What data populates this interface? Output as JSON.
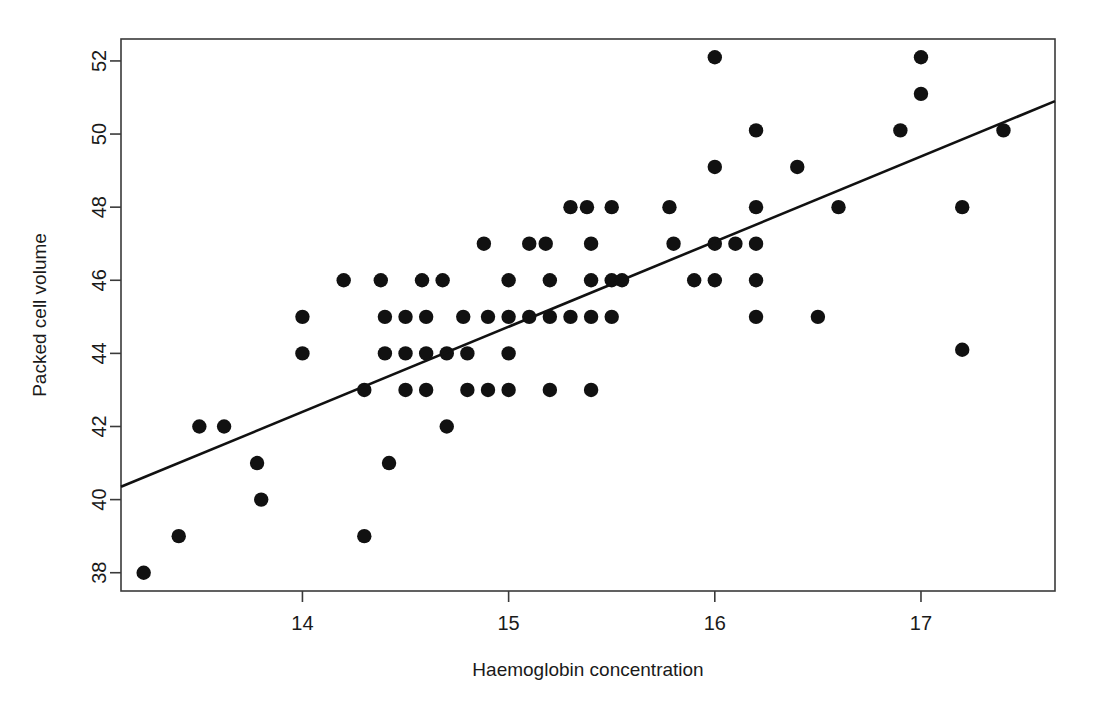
{
  "chart_data": {
    "type": "scatter",
    "title": "",
    "xlabel": "Haemoglobin concentration",
    "ylabel": "Packed cell volume",
    "xlim": [
      13.12,
      17.65
    ],
    "ylim": [
      37.5,
      52.6
    ],
    "xticks": [
      14,
      15,
      16,
      17
    ],
    "yticks": [
      38,
      40,
      42,
      44,
      46,
      48,
      50,
      52
    ],
    "xtick_labels": [
      "14",
      "15",
      "16",
      "17"
    ],
    "ytick_labels": [
      "38",
      "40",
      "42",
      "44",
      "46",
      "48",
      "50",
      "52"
    ],
    "grid": false,
    "legend": null,
    "annotations": [],
    "series": [
      {
        "name": "observations",
        "marker": "filled-circle",
        "color": "#111111",
        "points": [
          [
            13.23,
            38.0
          ],
          [
            13.4,
            39.0
          ],
          [
            13.5,
            42.0
          ],
          [
            13.62,
            42.0
          ],
          [
            13.78,
            41.0
          ],
          [
            13.8,
            40.0
          ],
          [
            14.0,
            45.0
          ],
          [
            14.0,
            44.0
          ],
          [
            14.2,
            46.0
          ],
          [
            14.3,
            43.0
          ],
          [
            14.3,
            39.0
          ],
          [
            14.38,
            46.0
          ],
          [
            14.4,
            45.0
          ],
          [
            14.4,
            44.0
          ],
          [
            14.42,
            41.0
          ],
          [
            14.5,
            45.0
          ],
          [
            14.5,
            44.0
          ],
          [
            14.5,
            43.0
          ],
          [
            14.58,
            46.0
          ],
          [
            14.6,
            45.0
          ],
          [
            14.6,
            44.0
          ],
          [
            14.6,
            43.0
          ],
          [
            14.68,
            46.0
          ],
          [
            14.7,
            44.0
          ],
          [
            14.7,
            42.0
          ],
          [
            14.78,
            45.0
          ],
          [
            14.8,
            44.0
          ],
          [
            14.8,
            43.0
          ],
          [
            14.88,
            47.0
          ],
          [
            14.9,
            45.0
          ],
          [
            14.9,
            43.0
          ],
          [
            15.0,
            46.0
          ],
          [
            15.0,
            45.0
          ],
          [
            15.0,
            44.0
          ],
          [
            15.0,
            43.0
          ],
          [
            15.1,
            47.0
          ],
          [
            15.1,
            45.0
          ],
          [
            15.18,
            47.0
          ],
          [
            15.2,
            46.0
          ],
          [
            15.2,
            45.0
          ],
          [
            15.2,
            43.0
          ],
          [
            15.3,
            48.0
          ],
          [
            15.3,
            45.0
          ],
          [
            15.38,
            48.0
          ],
          [
            15.4,
            47.0
          ],
          [
            15.4,
            46.0
          ],
          [
            15.4,
            45.0
          ],
          [
            15.4,
            43.0
          ],
          [
            15.5,
            48.0
          ],
          [
            15.5,
            46.0
          ],
          [
            15.5,
            45.0
          ],
          [
            15.55,
            46.0
          ],
          [
            15.78,
            48.0
          ],
          [
            15.8,
            47.0
          ],
          [
            15.9,
            46.0
          ],
          [
            16.0,
            52.1
          ],
          [
            16.0,
            49.1
          ],
          [
            16.0,
            47.0
          ],
          [
            16.0,
            46.0
          ],
          [
            16.1,
            47.0
          ],
          [
            16.2,
            50.1
          ],
          [
            16.2,
            48.0
          ],
          [
            16.2,
            47.0
          ],
          [
            16.2,
            46.0
          ],
          [
            16.2,
            45.0
          ],
          [
            16.4,
            49.1
          ],
          [
            16.5,
            45.0
          ],
          [
            16.6,
            48.0
          ],
          [
            16.9,
            50.1
          ],
          [
            17.0,
            52.1
          ],
          [
            17.0,
            51.1
          ],
          [
            17.2,
            48.0
          ],
          [
            17.2,
            44.1
          ],
          [
            17.4,
            50.1
          ]
        ]
      }
    ],
    "fit_line": {
      "name": "least-squares regression line",
      "color": "#111111",
      "x_start": 13.12,
      "y_start": 40.35,
      "x_end": 17.65,
      "y_end": 50.9
    }
  },
  "figure": {
    "background_color": "#ffffff",
    "frame_color": "#3a3a3a",
    "point_color": "#111111"
  }
}
